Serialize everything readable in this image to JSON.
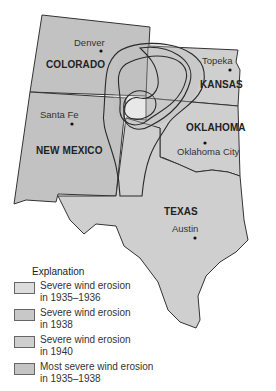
{
  "map": {
    "states": [
      {
        "name": "COLORADO"
      },
      {
        "name": "KANSAS"
      },
      {
        "name": "OKLAHOMA"
      },
      {
        "name": "NEW MEXICO"
      },
      {
        "name": "TEXAS"
      }
    ],
    "cities": [
      {
        "name": "Denver"
      },
      {
        "name": "Topeka"
      },
      {
        "name": "Santa Fe"
      },
      {
        "name": "Oklahoma City"
      },
      {
        "name": "Austin"
      }
    ]
  },
  "legend": {
    "title": "Explanation",
    "items": [
      {
        "line1": "Severe wind erosion",
        "line2": "in 1935–1936",
        "color": "#dcdcdc"
      },
      {
        "line1": "Severe wind erosion",
        "line2": "in 1938",
        "color": "#c8c8c8"
      },
      {
        "line1": "Severe wind erosion",
        "line2": "in 1940",
        "color": "#cfcfcf"
      },
      {
        "line1": "Most severe wind erosion",
        "line2": "in 1935–1938",
        "color": "#c4c4c4"
      }
    ]
  }
}
